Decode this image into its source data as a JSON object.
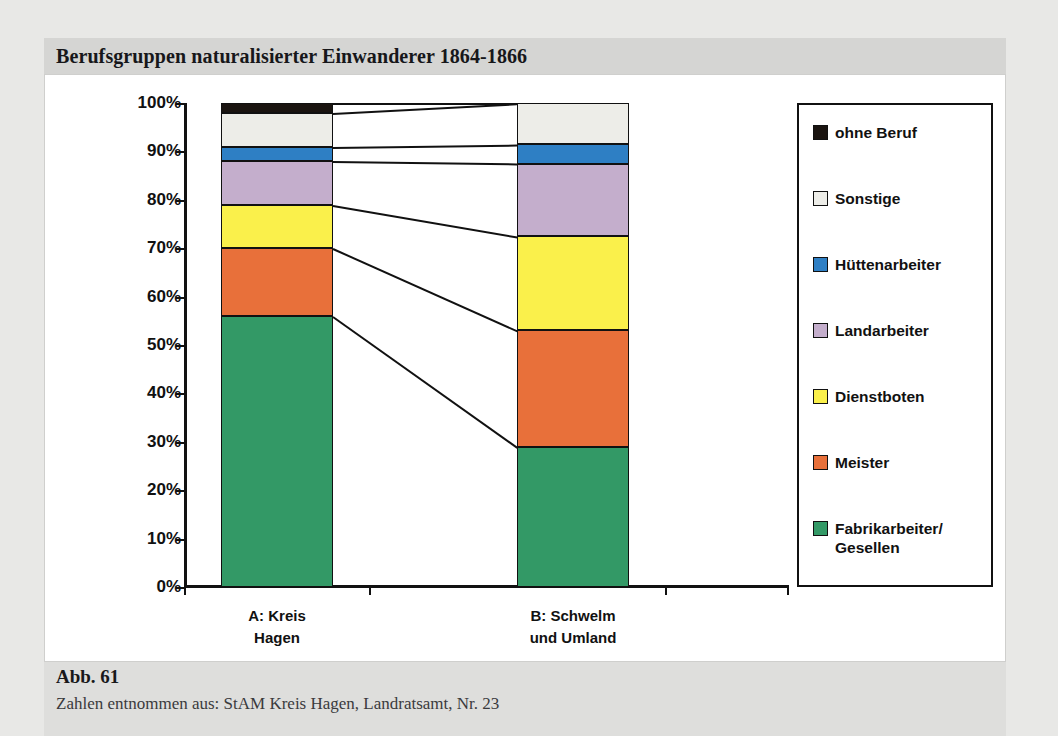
{
  "figure": {
    "title": "Berufsgruppen naturalisierter Einwanderer 1864-1866",
    "number": "Abb. 61",
    "source": "Zahlen entnommen aus: StAM Kreis Hagen, Landratsamt, Nr. 23"
  },
  "chart_data": {
    "type": "bar",
    "title": "Berufsgruppen naturalisierter Einwanderer 1864-1866",
    "xlabel": "",
    "ylabel": "",
    "stacked": true,
    "normalized": "percent",
    "grid": false,
    "legend_position": "right",
    "ylim": [
      0,
      100
    ],
    "yticks": [
      "0%",
      "10%",
      "20%",
      "30%",
      "40%",
      "50%",
      "60%",
      "70%",
      "80%",
      "90%",
      "100%"
    ],
    "categories": [
      "A: Kreis\nHagen",
      "B: Schwelm\nund Umland"
    ],
    "category_labels_flat": [
      "A: Kreis Hagen",
      "B: Schwelm und Umland"
    ],
    "series": [
      {
        "name": "Fabrikarbeiter/\nGesellen",
        "label": "Fabrikarbeiter/ Gesellen",
        "color": "#339966",
        "values": [
          56,
          29
        ]
      },
      {
        "name": "Meister",
        "label": "Meister",
        "color": "#E8703A",
        "values": [
          14,
          24
        ]
      },
      {
        "name": "Dienstboten",
        "label": "Dienstboten",
        "color": "#FAF04B",
        "values": [
          9,
          19.5
        ]
      },
      {
        "name": "Landarbeiter",
        "label": "Landarbeiter",
        "color": "#C4AECC",
        "values": [
          9,
          15
        ]
      },
      {
        "name": "Hüttenarbeiter",
        "label": "Hüttenarbeiter",
        "color": "#2E7FC4",
        "values": [
          3,
          4
        ]
      },
      {
        "name": "Sonstige",
        "label": "Sonstige",
        "color": "#EDEDE8",
        "values": [
          7,
          8.5
        ]
      },
      {
        "name": "ohne Beruf",
        "label": "ohne Beruf",
        "color": "#1A1410",
        "values": [
          2,
          0
        ]
      }
    ]
  }
}
